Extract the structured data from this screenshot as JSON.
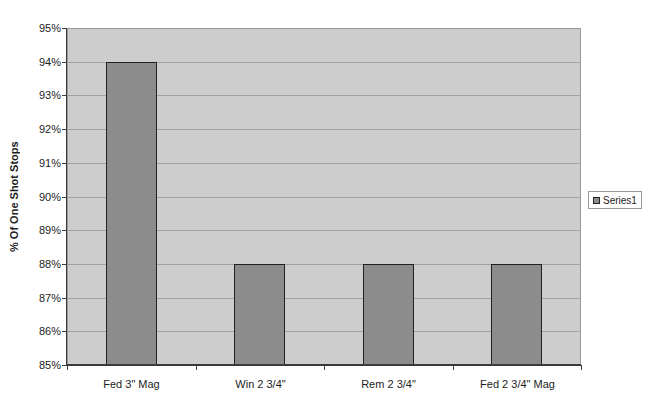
{
  "chart_data": {
    "type": "bar",
    "title": "",
    "categories": [
      "Fed 3\" Mag",
      "Win 2 3/4\"",
      "Rem 2 3/4\"",
      "Fed 2 3/4\" Mag"
    ],
    "values": [
      94,
      88,
      88,
      88
    ],
    "unit": "%",
    "xlabel": "",
    "ylabel": "% Of One Shot Stops",
    "ylim": [
      85,
      95
    ],
    "ytick_step": 1,
    "ytick_labels": [
      "85%",
      "86%",
      "87%",
      "88%",
      "89%",
      "90%",
      "91%",
      "92%",
      "93%",
      "94%",
      "95%"
    ],
    "grid": true,
    "legend": {
      "position": "right",
      "entries": [
        "Series1"
      ]
    },
    "colors": {
      "page_bg": "#ffffff",
      "plot_bg": "#cdcdcd",
      "bar_fill": "#8c8c8c",
      "bar_border": "#222222",
      "gridline": "#a2a2a2",
      "axis": "#3a3a3a",
      "legend_border": "#9a9a9a",
      "text": "#1c1c1c"
    }
  }
}
